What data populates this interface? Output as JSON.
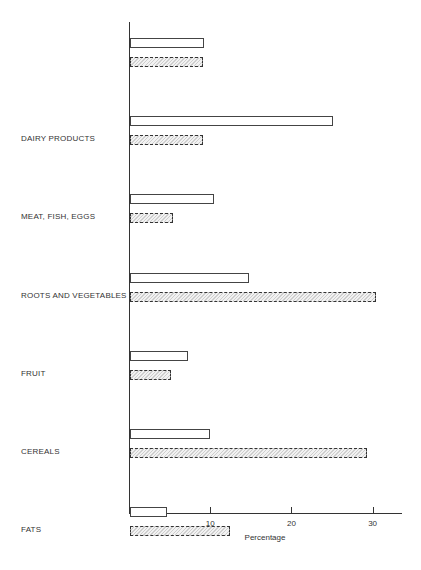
{
  "chart_data": {
    "type": "bar",
    "orientation": "horizontal",
    "title": "",
    "xlabel": "Percentage",
    "ylabel": "",
    "xlim": [
      0,
      33
    ],
    "x_ticks": [
      10,
      20,
      30
    ],
    "grid": false,
    "legend": null,
    "categories": [
      "",
      "DAIRY PRODUCTS",
      "MEAT, FISH, EGGS",
      "ROOTS AND VEGETABLES",
      "FRUIT",
      "CEREALS",
      "FATS",
      "SUGAR",
      "BEVERAGES"
    ],
    "series": [
      {
        "name": "open (white) bars",
        "style": "white",
        "values": [
          9.1,
          25.0,
          10.4,
          14.7,
          7.1,
          9.9,
          4.6,
          6.4,
          24.8
        ]
      },
      {
        "name": "hatched bars",
        "style": "hatched",
        "values": [
          9.0,
          9.0,
          5.3,
          30.3,
          5.1,
          29.2,
          12.3,
          4.6,
          4.8
        ]
      }
    ]
  },
  "labels": {
    "categories": [
      "",
      "DAIRY PRODUCTS",
      "MEAT, FISH, EGGS",
      "ROOTS AND VEGETABLES",
      "FRUIT",
      "CEREALS",
      "FATS",
      "SUGAR",
      "BEVERAGES"
    ],
    "x_ticks": [
      "10",
      "20",
      "30"
    ],
    "x_title": "Percentage"
  }
}
